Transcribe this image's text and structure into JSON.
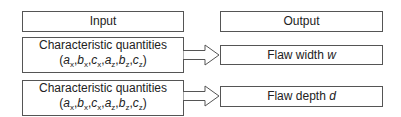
{
  "header": {
    "input_label": "Input",
    "output_label": "Output"
  },
  "rows": [
    {
      "input_title": "Characteristic quantities",
      "input_vars": [
        "a",
        "x",
        "b",
        "x",
        "c",
        "x",
        "a",
        "z",
        "b",
        "z",
        "c",
        "z"
      ],
      "output_label": "Flaw width ",
      "output_var": "w"
    },
    {
      "input_title": "Characteristic quantities",
      "input_vars": [
        "a",
        "x",
        "b",
        "x",
        "c",
        "x",
        "a",
        "z",
        "b",
        "z",
        "c",
        "z"
      ],
      "output_label": "Flaw depth ",
      "output_var": "d"
    }
  ]
}
